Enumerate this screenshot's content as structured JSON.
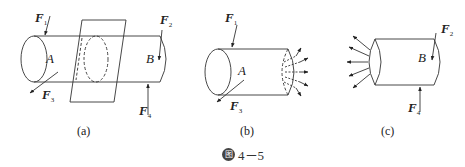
{
  "figure": {
    "caption_badge": "图",
    "caption_number": "4－5"
  },
  "panels": [
    {
      "label": "(a)",
      "section_labels": [
        "A",
        "B"
      ],
      "forces": [
        {
          "name": "F",
          "sub": "1"
        },
        {
          "name": "F",
          "sub": "2"
        },
        {
          "name": "F",
          "sub": "3"
        },
        {
          "name": "F",
          "sub": "4"
        }
      ]
    },
    {
      "label": "(b)",
      "section_labels": [
        "A"
      ],
      "forces": [
        {
          "name": "F",
          "sub": "1"
        },
        {
          "name": "F",
          "sub": "3"
        }
      ]
    },
    {
      "label": "(c)",
      "section_labels": [
        "B"
      ],
      "forces": [
        {
          "name": "F",
          "sub": "2"
        },
        {
          "name": "F",
          "sub": "4"
        }
      ]
    }
  ],
  "colors": {
    "line": "#333333",
    "text": "#222222"
  }
}
